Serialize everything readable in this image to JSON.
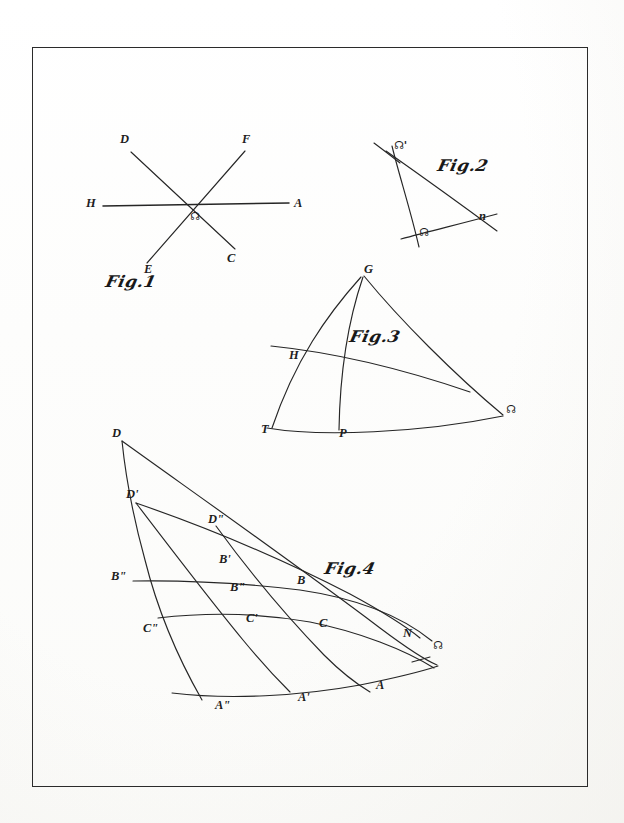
{
  "plate": {
    "background_color": "#fefefe",
    "frame_color": "#2b2b2b",
    "ink_color": "#1d1d1d",
    "width": 624,
    "height": 823
  },
  "figures": [
    {
      "id": "fig1",
      "caption": "Fig.1",
      "caption_script": "Fig.",
      "caption_number": "1",
      "description": "three straight lines crossing at a common node point",
      "node_label": "☊",
      "points": [
        {
          "name": "D",
          "label": "D",
          "x": 124,
          "y": 141
        },
        {
          "name": "F",
          "label": "F",
          "x": 245,
          "y": 141
        },
        {
          "name": "H",
          "label": "H",
          "x": 91,
          "y": 204
        },
        {
          "name": "A",
          "label": "A",
          "x": 297,
          "y": 204
        },
        {
          "name": "E",
          "label": "E",
          "x": 148,
          "y": 271
        },
        {
          "name": "C",
          "label": "C",
          "x": 230,
          "y": 259
        },
        {
          "name": "S",
          "label": "☊",
          "x": 194,
          "y": 215
        }
      ]
    },
    {
      "id": "fig2",
      "caption": "Fig.2",
      "caption_script": "Fig.",
      "caption_number": "2",
      "description": "spherical triangle formed by two great-circle arcs and the ecliptic",
      "points": [
        {
          "name": "S-prime",
          "label": "☊'",
          "x": 398,
          "y": 149
        },
        {
          "name": "S",
          "label": "☊",
          "x": 424,
          "y": 231
        },
        {
          "name": "n",
          "label": "n",
          "x": 482,
          "y": 215
        }
      ]
    },
    {
      "id": "fig3",
      "caption": "Fig.3",
      "caption_script": "Fig.",
      "caption_number": "3",
      "description": "spherical triangle with vertex G, base arc T to node, and transversal arc through H and P",
      "points": [
        {
          "name": "G",
          "label": "G",
          "x": 363,
          "y": 270
        },
        {
          "name": "H",
          "label": "H",
          "x": 293,
          "y": 355
        },
        {
          "name": "T",
          "label": "T",
          "x": 265,
          "y": 429
        },
        {
          "name": "P",
          "label": "P",
          "x": 342,
          "y": 433
        },
        {
          "name": "S",
          "label": "☊",
          "x": 510,
          "y": 409
        }
      ]
    },
    {
      "id": "fig4",
      "caption": "Fig.4",
      "caption_script": "Fig.",
      "caption_number": "4",
      "description": "family of great-circle arcs from node with successive positions D, D', D'' etc.",
      "points": [
        {
          "name": "D",
          "label": "D",
          "x": 115,
          "y": 434
        },
        {
          "name": "D-prime",
          "label": "D'",
          "x": 131,
          "y": 495
        },
        {
          "name": "D-dprime",
          "label": "D\"",
          "x": 210,
          "y": 520
        },
        {
          "name": "B-prime",
          "label": "B'",
          "x": 221,
          "y": 560
        },
        {
          "name": "B-dprime",
          "label": "B\"",
          "x": 116,
          "y": 577
        },
        {
          "name": "B-star",
          "label": "B\"",
          "x": 233,
          "y": 588
        },
        {
          "name": "B",
          "label": "B",
          "x": 298,
          "y": 581
        },
        {
          "name": "C-dprime",
          "label": "C\"",
          "x": 148,
          "y": 629
        },
        {
          "name": "C-prime",
          "label": "C'",
          "x": 249,
          "y": 619
        },
        {
          "name": "C",
          "label": "C",
          "x": 321,
          "y": 624
        },
        {
          "name": "N",
          "label": "N",
          "x": 406,
          "y": 634
        },
        {
          "name": "S",
          "label": "☊",
          "x": 437,
          "y": 645
        },
        {
          "name": "A-dprime",
          "label": "A\"",
          "x": 219,
          "y": 706
        },
        {
          "name": "A-prime",
          "label": "A'",
          "x": 301,
          "y": 698
        },
        {
          "name": "A",
          "label": "A",
          "x": 378,
          "y": 686
        }
      ]
    }
  ],
  "captions": [
    {
      "id": "cap1",
      "text": "Fig.1",
      "x": 104,
      "y": 279
    },
    {
      "id": "cap2",
      "text": "Fig.2",
      "x": 438,
      "y": 163
    },
    {
      "id": "cap3",
      "text": "Fig.3",
      "x": 350,
      "y": 334
    },
    {
      "id": "cap4",
      "text": "Fig.4",
      "x": 325,
      "y": 566
    }
  ]
}
